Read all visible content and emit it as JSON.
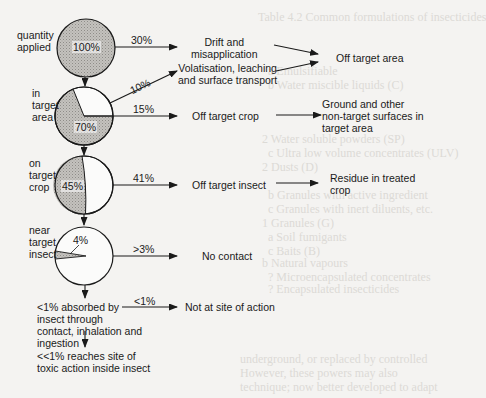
{
  "background_ghost_text": [
    "Table 4.2 Common formulations of insecticides",
    "a Emulsifiable",
    "b Water miscible liquids (C)",
    "c ... (WP)",
    "2 Water soluble powders (SP)",
    "c Ultra low volume concentrates (ULV)",
    "2 Dusts (D)",
    "b Granules with active ingredient",
    "c Granules with inert diluents, etc.",
    "1 Granules (G)",
    "a Soil fumigants",
    "c Baits (B)",
    "b Natural vapours",
    "? Microencapsulated concentrates",
    "? Encapsulated insecticides",
    "underground, or replaced by controlled",
    "However, these powers may also",
    "technique; now better developed to adapt"
  ],
  "stages": [
    {
      "label": "quantity\napplied",
      "pie_value": "100%",
      "shaded_fraction": 1.0
    },
    {
      "label": "in\ntarget\narea",
      "pie_value": "70%",
      "shaded_fraction": 0.7
    },
    {
      "label": "on\ntarget\ncrop",
      "pie_value": "45%",
      "shaded_fraction": 0.45
    },
    {
      "label": "near\ntarget\ninsect",
      "pie_value": "4%",
      "shaded_fraction": 0.04
    },
    {
      "label": "<1% absorbed by\ninsect through\ncontact, inhalation and\ningestion"
    },
    {
      "label": "<<1% reaches site of\ntoxic action inside insect"
    }
  ],
  "losses": [
    {
      "percent": "30%",
      "destination": "Drift and\nmisapplication"
    },
    {
      "percent": "10%",
      "destination": "Volatisation, leaching\nand surface transport"
    },
    {
      "percent": "15%",
      "destination": "Off target crop"
    },
    {
      "percent": "41%",
      "destination": "Off target insect"
    },
    {
      "percent": ">3%",
      "destination": "No contact"
    },
    {
      "percent": "<1%",
      "destination": "Not at site of action"
    }
  ],
  "outcomes": {
    "off_target_area": "Off target area",
    "ground_surfaces": "Ground and other\nnon-target surfaces in\ntarget area",
    "residue": "Residue in treated\ncrop"
  },
  "colors": {
    "shade": "#b8b6b2",
    "stroke": "#1a1a1a",
    "background": "#f4f3f1"
  }
}
